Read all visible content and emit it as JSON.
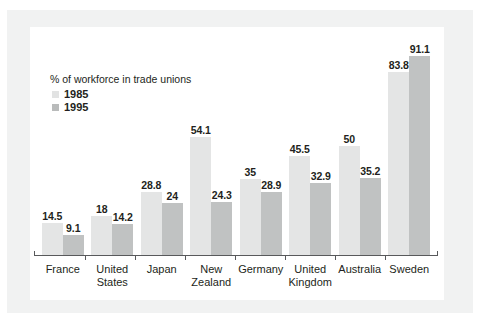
{
  "chart_data": {
    "type": "bar",
    "title": "",
    "legend_title": "% of workforce in trade unions",
    "legend_position": "inside-top-left",
    "xlabel": "",
    "ylabel": "",
    "ylim": [
      0,
      100
    ],
    "grid": false,
    "axis_visible": "x-baseline-only-with-ticks",
    "categories": [
      "France",
      "United States",
      "Japan",
      "New Zealand",
      "Germany",
      "United Kingdom",
      "Australia",
      "Sweden"
    ],
    "category_lines": [
      [
        "France"
      ],
      [
        "United",
        "States"
      ],
      [
        "Japan"
      ],
      [
        "New",
        "Zealand"
      ],
      [
        "Germany"
      ],
      [
        "United",
        "Kingdom"
      ],
      [
        "Australia"
      ],
      [
        "Sweden"
      ]
    ],
    "series": [
      {
        "name": "1985",
        "color": "#e4e5e5",
        "values": [
          14.5,
          18,
          28.8,
          54.1,
          35,
          45.5,
          50,
          83.8
        ],
        "labels": [
          "14.5",
          "18",
          "28.8",
          "54.1",
          "35",
          "45.5",
          "50",
          "83.8"
        ]
      },
      {
        "name": "1995",
        "color": "#c0c2c2",
        "values": [
          9.1,
          14.2,
          24,
          24.3,
          28.9,
          32.9,
          35.2,
          91.1
        ],
        "labels": [
          "9.1",
          "14.2",
          "24",
          "24.3",
          "28.9",
          "32.9",
          "35.2",
          "91.1"
        ]
      }
    ]
  },
  "legend": {
    "title": "% of workforce in trade unions",
    "items": [
      {
        "label": "1985",
        "color": "#e4e5e5"
      },
      {
        "label": "1995",
        "color": "#c0c2c2"
      }
    ]
  },
  "colors": {
    "series_1985": "#e4e5e5",
    "series_1995": "#c0c2c2",
    "axis": "#58595b",
    "text": "#231f20",
    "panel_background": "#ffffff",
    "frame_background": "#f1f2f2"
  }
}
